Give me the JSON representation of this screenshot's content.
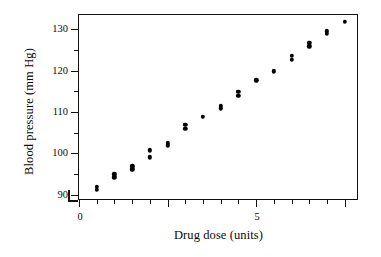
{
  "chart_data": {
    "type": "scatter",
    "title": "",
    "xlabel": "Drug dose (units)",
    "ylabel": "Blood pressure (mm Hg)",
    "xlim": [
      0,
      15.8
    ],
    "ylim": [
      88.5,
      133.5
    ],
    "xticks": [
      0,
      5,
      10,
      15
    ],
    "xticklabels": [
      "0",
      "5",
      "10",
      "15"
    ],
    "xminorticks": [
      1,
      2,
      3,
      4,
      6,
      7,
      8,
      9,
      11,
      12,
      13,
      14
    ],
    "yticks": [
      90,
      100,
      110,
      120,
      130
    ],
    "yticklabels": [
      "90",
      "100",
      "110",
      "120",
      "130"
    ],
    "yminorticks": [
      95,
      105,
      115,
      125
    ],
    "grid": false,
    "legend": null,
    "marker": "filled-circle",
    "marker_color": "#000000",
    "x": [
      1,
      1,
      2,
      2,
      3,
      3,
      4,
      4,
      5,
      5,
      6,
      6,
      7,
      8,
      8,
      9,
      9,
      10,
      11,
      12,
      12,
      13,
      13,
      14,
      14,
      15
    ],
    "y": [
      91.2,
      92.0,
      94.2,
      95.0,
      96.2,
      96.9,
      99.1,
      100.8,
      102.0,
      102.6,
      106.0,
      106.9,
      108.9,
      110.9,
      111.5,
      114.0,
      114.9,
      117.7,
      119.9,
      122.7,
      123.7,
      125.9,
      126.7,
      128.9,
      129.6,
      131.8
    ]
  },
  "axes": {
    "x_axis_name": "drug-dose-axis",
    "y_axis_name": "blood-pressure-axis"
  }
}
